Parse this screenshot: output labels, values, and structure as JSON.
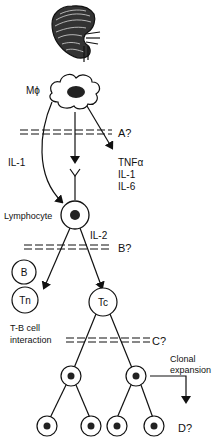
{
  "diagram": {
    "organ": "kidney",
    "macrophage_label": "Mϕ",
    "checkpoints": {
      "a": "A?",
      "b": "B?",
      "c": "C?",
      "d": "D?"
    },
    "cytokines_secreted": [
      "TNFα",
      "IL-1",
      "IL-6"
    ],
    "il1_label": "IL-1",
    "lymphocyte_label": "Lymphocyte",
    "il2_label": "IL-2",
    "cells": {
      "b": "B",
      "tn": "Tn",
      "tc": "Tc"
    },
    "tb_interaction": [
      "T-B cell",
      "interaction"
    ],
    "clonal_expansion": [
      "Clonal",
      "expansion"
    ]
  }
}
